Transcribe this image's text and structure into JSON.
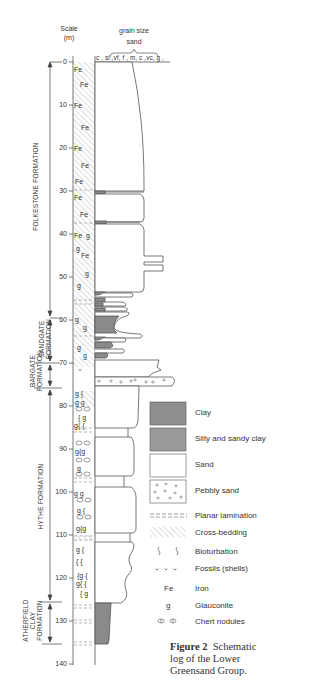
{
  "scale": {
    "title_line1": "Scale",
    "title_line2": "(m)"
  },
  "grain_size": {
    "title": "grain size",
    "subtitle": "sand",
    "columns": "c , si ,vf, f , m, c ,vc, g ,"
  },
  "depth_ticks": [
    "0",
    "10",
    "20",
    "30",
    "40",
    "50",
    "60",
    "70",
    "80",
    "90",
    "100",
    "110",
    "120",
    "130",
    "140"
  ],
  "formations": [
    {
      "name": "FOLKESTONE FORMATION",
      "top_m": 0,
      "base_m": 59
    },
    {
      "name_line1": "SANDGATE",
      "name_line2": "FORMATION",
      "top_m": 59,
      "base_m": 70
    },
    {
      "name_line1": "BARGATE",
      "name_line2": "FORMATION",
      "top_m": 70,
      "base_m": 76
    },
    {
      "name": "HYTHE FORMATION",
      "top_m": 76,
      "base_m": 126
    },
    {
      "name_line1": "ATHERFIELD",
      "name_line2": "CLAY",
      "name_line3": "FORMATION",
      "top_m": 126,
      "base_m": 135
    }
  ],
  "annotations": {
    "fe": "Fe",
    "g": "g",
    "gg": "g  g",
    "g_bio": "g {",
    "bio_g": "{ g",
    "g_bio_g": "g{g",
    "bio": "{ {",
    "bio_g2": "{g {",
    "g_bio2": "g{ {"
  },
  "legend": {
    "clay": "Clay",
    "silty_clay": "Silty and sandy clay",
    "sand": "Sand",
    "pebbly_sand": "Pebbly sand",
    "planar_lamination": "Planar lamination",
    "cross_bedding": "Cross-bedding",
    "bioturbation": "Bioturbation",
    "fossils": "Fossils (shells)",
    "iron_symbol": "Fe",
    "iron": "Iron",
    "glauconite_symbol": "g",
    "glauconite": "Glauconite",
    "chert_nodules": "Chert nodules"
  },
  "caption": {
    "figure_label": "Figure 2",
    "text_line1": "Schematic",
    "text_line2": "log of the Lower",
    "text_line3": "Greensand Group."
  },
  "colors": {
    "clay": "#8a8a8a",
    "silty_clay": "#9a9a9a",
    "sand": "#ffffff",
    "line": "#555555",
    "hatch": "#bdbdbd"
  }
}
